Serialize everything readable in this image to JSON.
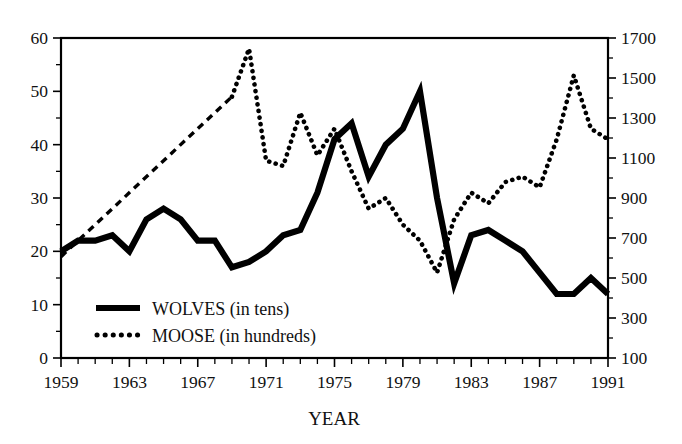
{
  "figure": {
    "background_color": "#ffffff",
    "ink_color": "#000000"
  },
  "axis": {
    "x_title": "YEAR",
    "left_tick_labels": [
      "0",
      "10",
      "20",
      "30",
      "40",
      "50",
      "60"
    ],
    "right_tick_labels": [
      "100",
      "300",
      "500",
      "700",
      "900",
      "1100",
      "1300",
      "1500",
      "1700"
    ],
    "x_tick_labels": [
      "1959",
      "1963",
      "1967",
      "1971",
      "1975",
      "1979",
      "1983",
      "1987",
      "1991"
    ]
  },
  "legend": {
    "entries": [
      {
        "label": "WOLVES (in tens)",
        "style": "solid",
        "icon": "solid-line-icon"
      },
      {
        "label": "MOOSE (in hundreds)",
        "style": "dotted",
        "icon": "dotted-line-icon"
      }
    ]
  },
  "chart_data": {
    "type": "line",
    "title": "",
    "subtitle": "",
    "xlabel": "YEAR",
    "ylabel": "",
    "ylabel_right": "",
    "grid": false,
    "legend_position": "inside-lower-left",
    "xlim": [
      1959,
      1991
    ],
    "ylim_left": [
      0,
      60
    ],
    "ylim_right": [
      100,
      1700
    ],
    "left_axis_ticks": [
      0,
      10,
      20,
      30,
      40,
      50,
      60
    ],
    "right_axis_ticks": [
      100,
      300,
      500,
      700,
      900,
      1100,
      1300,
      1500,
      1700
    ],
    "x_ticks_all_years": true,
    "x_ticks_labeled": [
      1959,
      1963,
      1967,
      1971,
      1975,
      1979,
      1983,
      1987,
      1991
    ],
    "x": [
      1959,
      1960,
      1961,
      1962,
      1963,
      1964,
      1965,
      1966,
      1967,
      1968,
      1969,
      1970,
      1971,
      1972,
      1973,
      1974,
      1975,
      1976,
      1977,
      1978,
      1979,
      1980,
      1981,
      1982,
      1983,
      1984,
      1985,
      1986,
      1987,
      1988,
      1989,
      1990,
      1991
    ],
    "series": [
      {
        "name": "WOLVES (in tens)",
        "axis": "left",
        "units": "tens of wolves",
        "style": "solid",
        "values": [
          20,
          22,
          22,
          23,
          20,
          26,
          28,
          26,
          22,
          22,
          17,
          18,
          20,
          23,
          24,
          31,
          41,
          44,
          34,
          40,
          43,
          50,
          30,
          14,
          23,
          24,
          22,
          20,
          16,
          12,
          12,
          15,
          12
        ]
      },
      {
        "name": "MOOSE (in hundreds)",
        "axis": "right",
        "units": "hundreds of moose",
        "style": "dotted",
        "note": "1959-1969 values are interpolated and drawn as a straight dashed segment",
        "values": [
          19,
          22,
          25,
          28,
          31,
          34,
          37,
          40,
          43,
          46,
          49,
          58,
          37,
          36,
          46,
          38,
          43,
          35,
          28,
          30,
          25,
          22,
          16,
          26,
          31,
          29,
          33,
          34,
          32,
          41,
          53,
          43,
          41
        ]
      }
    ],
    "annotations": [
      {
        "text": "Wolf population peak",
        "x": 1980,
        "y_left": 50
      },
      {
        "text": "Wolf population crash",
        "x": 1982,
        "y_left": 14
      },
      {
        "text": "Moose population peak",
        "x": 1970,
        "y_left": 58,
        "y_right": 1660
      }
    ]
  }
}
